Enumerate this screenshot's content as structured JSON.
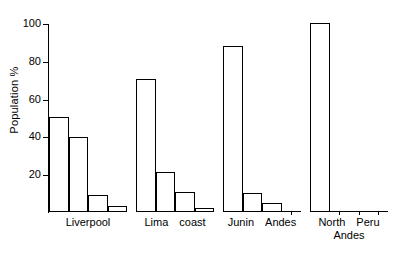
{
  "chart_data": {
    "type": "bar",
    "title": "",
    "subtitle": "",
    "xlabel": "",
    "ylabel": "Population  %",
    "ylim": [
      0,
      100
    ],
    "yticks": [
      20,
      40,
      60,
      80,
      100
    ],
    "ytick_labels": [
      "20",
      "40",
      "60",
      "80",
      "100"
    ],
    "grid": false,
    "legend": false,
    "legend_position": "none",
    "annotations": [],
    "bar_style": {
      "fill": "#ffffff",
      "edge_color": "#000000",
      "edge_width": 1
    },
    "groups": [
      {
        "name": "liverpool",
        "label_line1": "Liverpool",
        "label_line2": "",
        "label_words": [
          "Liverpool"
        ],
        "values": [
          50,
          39,
          8.5,
          2.5
        ]
      },
      {
        "name": "lima-coast",
        "label_line1": "Lima   coast",
        "label_line2": "",
        "label_words": [
          "Lima",
          "coast"
        ],
        "values": [
          70,
          20.5,
          10,
          1.5
        ]
      },
      {
        "name": "junin-andes",
        "label_line1": "Junin  Andes",
        "label_line2": "",
        "label_words": [
          "Junin",
          "Andes"
        ],
        "values": [
          87.5,
          9.5,
          4,
          0
        ]
      },
      {
        "name": "north-peru-andes",
        "label_line1": "North  Peru",
        "label_line2": "Andes",
        "label_words": [
          "North",
          "Peru"
        ],
        "values": [
          99.5,
          0,
          0,
          0
        ]
      }
    ],
    "categories": [
      "Liverpool",
      "Lima coast",
      "Junin Andes",
      "North Peru Andes"
    ],
    "series": [
      {
        "name": "bar-1",
        "values": [
          50,
          70,
          87.5,
          99.5
        ]
      },
      {
        "name": "bar-2",
        "values": [
          39,
          20.5,
          9.5,
          0
        ]
      },
      {
        "name": "bar-3",
        "values": [
          8.5,
          10,
          4,
          0
        ]
      },
      {
        "name": "bar-4",
        "values": [
          2.5,
          1.5,
          0,
          0
        ]
      }
    ],
    "colors": {
      "axis": "#000000",
      "bar_edge": "#000000",
      "bar_fill": "#ffffff",
      "background": "#ffffff",
      "text": "#000000"
    }
  }
}
